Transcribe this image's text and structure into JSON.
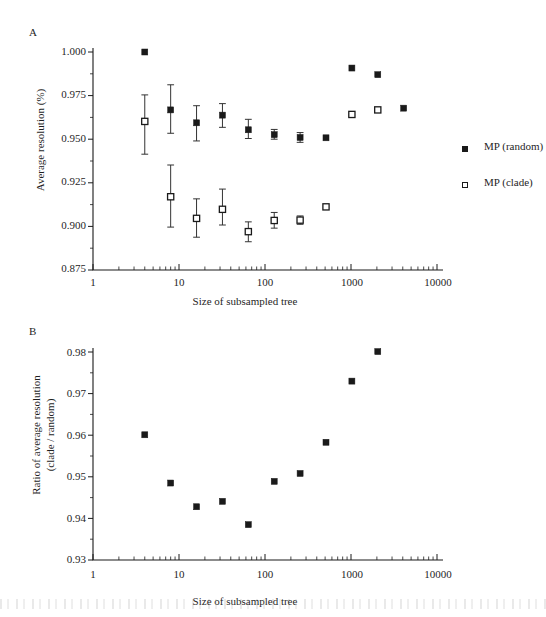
{
  "figure": {
    "panel_a_letter": "A",
    "panel_b_letter": "B"
  },
  "legend": {
    "items": [
      {
        "label": "MP (random)",
        "marker": "filled-square-icon",
        "color": "#1a1a1a"
      },
      {
        "label": "MP (clade)",
        "marker": "open-square-icon",
        "color": "#1a1a1a"
      }
    ]
  },
  "chart_data": [
    {
      "type": "scatter",
      "panel": "A",
      "title": "",
      "xlabel": "Size of subsampled tree",
      "ylabel": "Average resolution (%)",
      "xscale": "log",
      "xlim": [
        1,
        10000
      ],
      "ylim": [
        0.875,
        1.0
      ],
      "grid": false,
      "legend_position": "right",
      "xticks": [
        1,
        10,
        100,
        1000,
        10000
      ],
      "xtick_labels": [
        "1",
        "10",
        "100",
        "1000",
        "10000"
      ],
      "yticks": [
        0.875,
        0.9,
        0.925,
        0.95,
        0.975,
        1.0
      ],
      "ytick_labels": [
        "0.875",
        "0.900",
        "0.925",
        "0.950",
        "0.975",
        "1.000"
      ],
      "series": [
        {
          "name": "MP (random)",
          "marker": "filled-square",
          "x": [
            4,
            8,
            16,
            32,
            64,
            128,
            256,
            512,
            1024,
            2048,
            4096
          ],
          "values": [
            1.0,
            0.9668,
            0.9594,
            0.9638,
            0.9554,
            0.9526,
            0.951,
            0.9508,
            0.9908,
            0.987,
            0.9678
          ],
          "err_low": [
            null,
            0.9534,
            0.949,
            0.9568,
            0.9504,
            0.95,
            0.9482,
            null,
            null,
            null,
            null
          ],
          "err_high": [
            null,
            0.9812,
            0.9692,
            0.9704,
            0.9614,
            0.9556,
            0.9538,
            null,
            null,
            null,
            null
          ]
        },
        {
          "name": "MP (clade)",
          "marker": "open-square",
          "x": [
            4,
            8,
            16,
            32,
            64,
            128,
            256,
            512,
            1024,
            2048
          ],
          "values": [
            0.9602,
            0.917,
            0.9046,
            0.9098,
            0.897,
            0.9034,
            0.9036,
            0.9112,
            0.9642,
            0.9668
          ],
          "err_low": [
            0.9414,
            0.8996,
            0.8938,
            0.9008,
            0.8912,
            0.899,
            0.9012,
            null,
            null,
            null
          ],
          "err_high": [
            0.9754,
            0.9352,
            0.9158,
            0.9214,
            0.9026,
            0.908,
            0.906,
            null,
            null,
            null
          ]
        }
      ]
    },
    {
      "type": "scatter",
      "panel": "B",
      "title": "",
      "xlabel": "Size of subsampled tree",
      "ylabel": "Ratio of average resolution (clade / random)",
      "ylabel_line1": "Ratio of average resolution",
      "ylabel_line2": "(clade / random)",
      "xscale": "log",
      "xlim": [
        1,
        10000
      ],
      "ylim": [
        0.93,
        0.98
      ],
      "grid": false,
      "xticks": [
        1,
        10,
        100,
        1000,
        10000
      ],
      "xtick_labels": [
        "1",
        "10",
        "100",
        "1000",
        "10000"
      ],
      "yticks": [
        0.93,
        0.94,
        0.95,
        0.96,
        0.97,
        0.98
      ],
      "ytick_labels": [
        "0.93",
        "0.94",
        "0.95",
        "0.96",
        "0.97",
        "0.98"
      ],
      "series": [
        {
          "name": "clade / random ratio",
          "marker": "filled-square",
          "x": [
            4,
            8,
            16,
            32,
            64,
            128,
            256,
            512,
            1024,
            2048
          ],
          "values": [
            0.9601,
            0.9485,
            0.9428,
            0.9441,
            0.9385,
            0.9489,
            0.9508,
            0.9583,
            0.973,
            0.9801
          ]
        }
      ]
    }
  ]
}
